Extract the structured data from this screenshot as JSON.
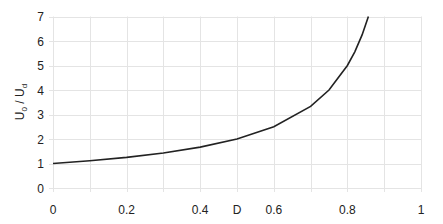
{
  "chart_data": {
    "type": "line",
    "title": "",
    "xlabel": "D",
    "ylabel": "U0 / Ud",
    "ylabel_parts": {
      "base1": "U",
      "sub1": "0",
      "sep": " / ",
      "base2": "U",
      "sub2": "d"
    },
    "xlim": [
      0,
      1
    ],
    "ylim": [
      0,
      7
    ],
    "x_ticks": [
      "0",
      "0.2",
      "0.4",
      "0.6",
      "0.8",
      "1"
    ],
    "x_tick_values": [
      0,
      0.2,
      0.4,
      0.6,
      0.8,
      1
    ],
    "y_ticks": [
      "0",
      "1",
      "2",
      "3",
      "4",
      "5",
      "6",
      "7"
    ],
    "y_tick_values": [
      0,
      1,
      2,
      3,
      4,
      5,
      6,
      7
    ],
    "x_grid_step": 0.1,
    "y_grid_step": 1,
    "grid": true,
    "legend": null,
    "series": [
      {
        "name": "U0/Ud = 1/(1-D)",
        "color": "#222222",
        "x": [
          0,
          0.1,
          0.2,
          0.3,
          0.4,
          0.5,
          0.6,
          0.7,
          0.75,
          0.8,
          0.82,
          0.84,
          0.857
        ],
        "y": [
          1.0,
          1.11,
          1.25,
          1.43,
          1.67,
          2.0,
          2.5,
          3.33,
          4.0,
          5.0,
          5.56,
          6.25,
          7.0
        ]
      }
    ]
  }
}
